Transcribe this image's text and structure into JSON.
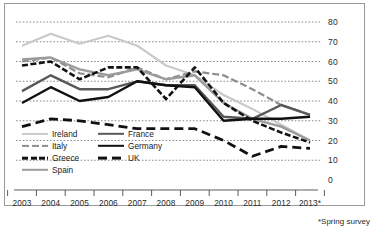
{
  "footnote": "*Spring survey",
  "legend": {
    "column_a": [
      {
        "label": "Ireland",
        "key": "Ireland"
      },
      {
        "label": "Italy",
        "key": "Italy"
      },
      {
        "label": "Greece",
        "key": "Greece"
      },
      {
        "label": "Spain",
        "key": "Spain"
      }
    ],
    "column_b": [
      {
        "label": "France",
        "key": "France"
      },
      {
        "label": "Germany",
        "key": "Germany"
      },
      {
        "label": "UK",
        "key": "UK"
      }
    ]
  },
  "styles": {
    "Ireland": {
      "color": "#c9c9c9",
      "width": 2.2,
      "dash": "none"
    },
    "Italy": {
      "color": "#8d8d8d",
      "width": 2.2,
      "dash": "7,3"
    },
    "Greece": {
      "color": "#121212",
      "width": 2.6,
      "dash": "6,2.5"
    },
    "Spain": {
      "color": "#9b9b9b",
      "width": 2.4,
      "dash": "none"
    },
    "France": {
      "color": "#595959",
      "width": 2.4,
      "dash": "none"
    },
    "Germany": {
      "color": "#111111",
      "width": 2.4,
      "dash": "none"
    },
    "UK": {
      "color": "#111111",
      "width": 2.8,
      "dash": "9,5"
    }
  },
  "chart_data": {
    "type": "line",
    "title": "",
    "subtitle": "",
    "xlabel": "",
    "ylabel": "",
    "grid": true,
    "legend_position": "inside-bottom-left",
    "xlim": [
      2003,
      2013
    ],
    "ylim": [
      0,
      80
    ],
    "yticks": [
      0,
      10,
      20,
      30,
      40,
      50,
      60,
      70,
      80
    ],
    "categories": [
      "2003",
      "2004",
      "2005",
      "2006",
      "2007",
      "2008",
      "2009",
      "2010",
      "2011",
      "2012",
      "2013*"
    ],
    "series": [
      {
        "name": "Ireland",
        "values": [
          68,
          74,
          69,
          73,
          68,
          58,
          53,
          43,
          36,
          28,
          20
        ]
      },
      {
        "name": "Italy",
        "values": [
          60,
          62,
          54,
          52,
          57,
          51,
          55,
          53,
          46,
          38,
          33
        ]
      },
      {
        "name": "Greece",
        "values": [
          58,
          60,
          51,
          57,
          57,
          41,
          57,
          39,
          30,
          24,
          19
        ]
      },
      {
        "name": "Spain",
        "values": [
          61,
          62,
          56,
          53,
          56,
          51,
          53,
          39,
          31,
          27,
          20
        ]
      },
      {
        "name": "France",
        "values": [
          45,
          53,
          46,
          46,
          50,
          48,
          48,
          32,
          31,
          38,
          33
        ]
      },
      {
        "name": "Germany",
        "values": [
          39,
          47,
          40,
          42,
          50,
          48,
          47,
          30,
          31,
          31,
          32
        ]
      },
      {
        "name": "UK",
        "values": [
          27,
          31,
          30,
          28,
          26,
          26,
          26,
          20,
          12,
          17,
          16
        ]
      }
    ]
  }
}
